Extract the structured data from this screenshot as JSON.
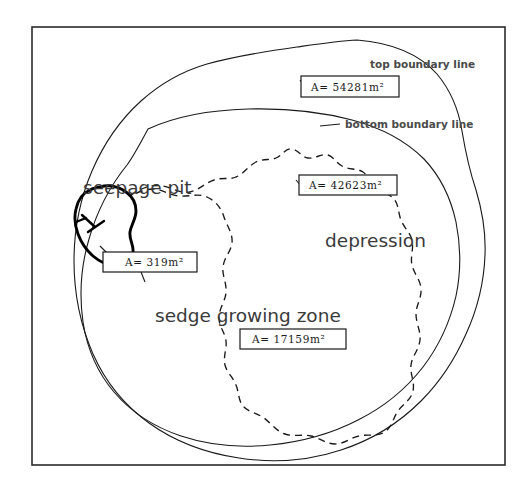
{
  "figure": {
    "background_color": "#ffffff",
    "line_color": "#1a1a1a",
    "frame": {
      "x": 32,
      "y": 27,
      "width": 473,
      "height": 438
    }
  },
  "annotations": {
    "top_boundary_label": "top boundary line",
    "bottom_boundary_label": "bottom boundary line",
    "seepage_pit_label": "seepage pit",
    "depression_label": "depression",
    "sedge_zone_label": "sedge growing zone"
  },
  "area_boxes": [
    {
      "id": "top-boundary-area",
      "prefix": "A=",
      "value": "54281",
      "unit": "m",
      "exponent": "2",
      "full_text": "A= 54281m²"
    },
    {
      "id": "depression-area",
      "prefix": "A=",
      "value": "42623",
      "unit": "m",
      "exponent": "2",
      "full_text": "A= 42623m²"
    },
    {
      "id": "seepage-pit-area",
      "prefix": "A=",
      "value": "319",
      "unit": "m",
      "exponent": "2",
      "full_text": "A= 319m²"
    },
    {
      "id": "sedge-zone-area",
      "prefix": "A=",
      "value": "17159",
      "unit": "m",
      "exponent": "2",
      "full_text": "A= 17159m²"
    }
  ],
  "legend": {
    "line_styles": [
      {
        "name": "top boundary line",
        "style": "solid"
      },
      {
        "name": "bottom boundary line",
        "style": "solid"
      },
      {
        "name": "sedge growing zone",
        "style": "dashed"
      },
      {
        "name": "seepage pit",
        "style": "solid-bold"
      }
    ]
  }
}
